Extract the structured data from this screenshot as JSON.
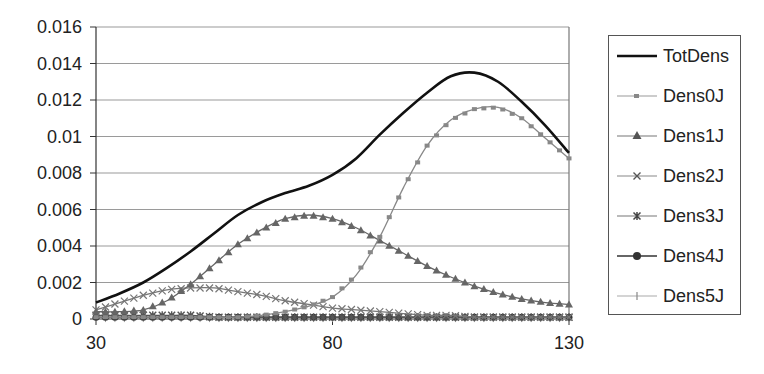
{
  "chart_data": {
    "type": "line",
    "title": "",
    "xlabel": "",
    "ylabel": "",
    "xlim": [
      30,
      130
    ],
    "ylim": [
      0,
      0.016
    ],
    "x_ticks": [
      "30",
      "80",
      "130"
    ],
    "y_ticks": [
      "0",
      "0.002",
      "0.004",
      "0.006",
      "0.008",
      "0.01",
      "0.012",
      "0.014",
      "0.016"
    ],
    "grid": "horizontal",
    "legend_position": "right",
    "x": [
      30,
      35,
      40,
      45,
      50,
      55,
      60,
      65,
      70,
      75,
      80,
      85,
      90,
      95,
      100,
      105,
      110,
      115,
      120,
      125,
      130
    ],
    "series": [
      {
        "name": "TotDens",
        "marker": "none",
        "color": "#111111",
        "values": [
          0.0009,
          0.0014,
          0.002,
          0.0028,
          0.0037,
          0.0047,
          0.0057,
          0.0064,
          0.0069,
          0.0073,
          0.0079,
          0.0088,
          0.0101,
          0.0113,
          0.0124,
          0.0133,
          0.0135,
          0.013,
          0.0119,
          0.0106,
          0.0091
        ]
      },
      {
        "name": "Dens0J",
        "marker": "square",
        "color": "#888888",
        "values": [
          0.0001,
          0.0001,
          0.0001,
          0.0001,
          0.0001,
          0.0001,
          0.0001,
          0.0002,
          0.0004,
          0.0007,
          0.0012,
          0.0024,
          0.0045,
          0.0072,
          0.0095,
          0.0109,
          0.0115,
          0.0116,
          0.011,
          0.0099,
          0.0088
        ]
      },
      {
        "name": "Dens1J",
        "marker": "triangle",
        "color": "#666666",
        "values": [
          0.0004,
          0.0004,
          0.0005,
          0.001,
          0.0019,
          0.003,
          0.0041,
          0.0049,
          0.0055,
          0.0057,
          0.0055,
          0.005,
          0.0043,
          0.0036,
          0.0029,
          0.0023,
          0.0018,
          0.0014,
          0.0011,
          0.0009,
          0.0008
        ]
      },
      {
        "name": "Dens2J",
        "marker": "x",
        "color": "#777777",
        "values": [
          0.0005,
          0.0009,
          0.0013,
          0.0016,
          0.0017,
          0.0017,
          0.0015,
          0.0013,
          0.001,
          0.0008,
          0.0006,
          0.0005,
          0.0004,
          0.0003,
          0.0002,
          0.0002,
          0.0001,
          0.0001,
          0.0001,
          0.0001,
          0.0001
        ]
      },
      {
        "name": "Dens3J",
        "marker": "star",
        "color": "#555555",
        "values": [
          0.0002,
          0.0002,
          0.0002,
          0.0002,
          0.0002,
          0.0001,
          0.0001,
          0.0001,
          0.0001,
          0.0001,
          0.0001,
          0.0001,
          0.0001,
          0.0001,
          0.0001,
          0.0001,
          0.0001,
          0.0001,
          0.0001,
          0.0001,
          0.0001
        ]
      },
      {
        "name": "Dens4J",
        "marker": "circle",
        "color": "#333333",
        "values": [
          0.0001,
          0.0001,
          0.0001,
          0.0001,
          0.0001,
          0.0001,
          0.0001,
          0.0001,
          0.0001,
          0.0001,
          0.0001,
          0.0001,
          0.0001,
          0.0001,
          0.0001,
          0.0001,
          0.0001,
          0.0001,
          0.0001,
          0.0001,
          0.0001
        ]
      },
      {
        "name": "Dens5J",
        "marker": "plus",
        "color": "#999999",
        "values": [
          5e-05,
          5e-05,
          5e-05,
          5e-05,
          5e-05,
          5e-05,
          5e-05,
          5e-05,
          5e-05,
          5e-05,
          5e-05,
          5e-05,
          5e-05,
          5e-05,
          5e-05,
          5e-05,
          5e-05,
          5e-05,
          5e-05,
          5e-05,
          5e-05
        ]
      }
    ]
  },
  "legend": {
    "items": [
      "TotDens",
      "Dens0J",
      "Dens1J",
      "Dens2J",
      "Dens3J",
      "Dens4J",
      "Dens5J"
    ]
  }
}
